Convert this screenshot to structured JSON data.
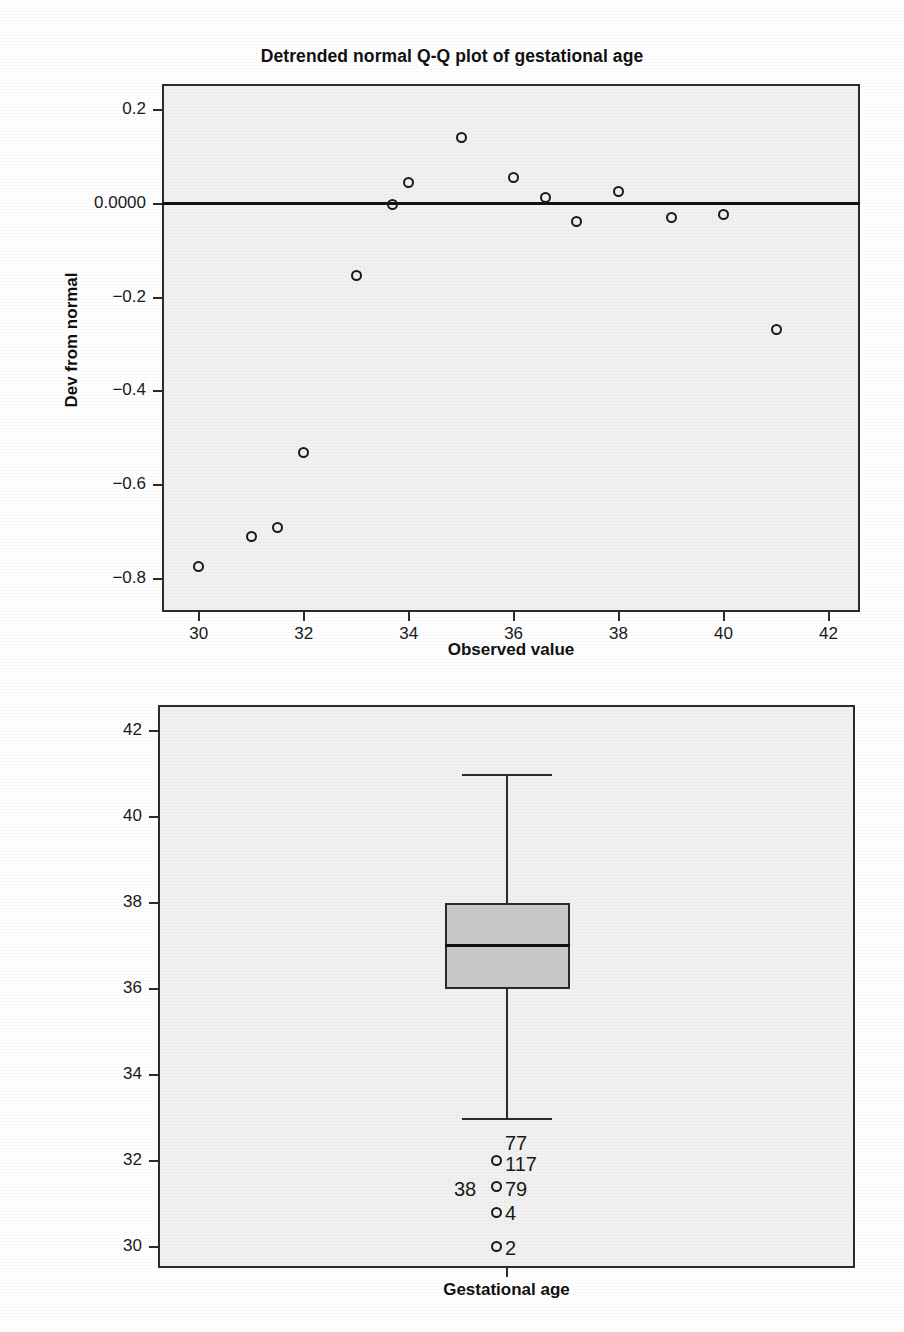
{
  "page": {
    "width": 904,
    "height": 1332,
    "background": "#ffffff",
    "plot_background": "#f1f1f1",
    "ink_color": "#1a1a1a",
    "box_fill": "#c9c9c9"
  },
  "figures": [
    {
      "id": "qq-plot",
      "title": "Detrended normal Q-Q plot of gestational age"
    },
    {
      "id": "boxplot",
      "title": ""
    }
  ],
  "qq": {
    "title": "Detrended normal Q-Q plot of gestational age",
    "xlabel": "Observed value",
    "ylabel": "Dev from normal",
    "yticks": [
      "0.2",
      "0.0000",
      "-0.2",
      "-0.4",
      "-0.6",
      "-0.8"
    ],
    "xticks": [
      "30",
      "32",
      "34",
      "36",
      "38",
      "40",
      "42"
    ]
  },
  "box": {
    "xlabel": "Gestational age",
    "yticks": [
      "42",
      "40",
      "38",
      "36",
      "34",
      "32",
      "30"
    ],
    "outlier_labels": [
      "77",
      "117",
      "38",
      "79",
      "4",
      "2"
    ]
  },
  "chart_data": [
    {
      "type": "scatter",
      "id": "detrended-qq",
      "title": "Detrended normal Q-Q plot of gestational age",
      "xlabel": "Observed value",
      "ylabel": "Dev from normal",
      "xlim": [
        29.3,
        42.6
      ],
      "ylim": [
        -0.87,
        0.255
      ],
      "xticks": [
        30,
        32,
        34,
        36,
        38,
        40,
        42
      ],
      "xticklabels": [
        "30",
        "32",
        "34",
        "36",
        "38",
        "40",
        "42"
      ],
      "yticks": [
        0.2,
        0.0,
        -0.2,
        -0.4,
        -0.6,
        -0.8
      ],
      "yticklabels": [
        "0.2",
        "0.0000",
        "-0.2",
        "-0.4",
        "-0.6",
        "-0.8"
      ],
      "grid": false,
      "legend": null,
      "reference_line": {
        "y": 0.0,
        "style": "solid",
        "color": "#111111"
      },
      "marker": "open-circle",
      "x": [
        30.0,
        31.0,
        31.5,
        32.0,
        33.0,
        33.7,
        34.0,
        35.0,
        36.0,
        36.6,
        37.2,
        38.0,
        39.0,
        40.0,
        41.0
      ],
      "y": [
        -0.773,
        -0.709,
        -0.69,
        -0.531,
        -0.152,
        -0.002,
        0.046,
        0.14,
        0.056,
        0.014,
        -0.038,
        0.026,
        -0.03,
        -0.022,
        -0.268
      ]
    },
    {
      "type": "boxplot",
      "id": "gestational-age-box",
      "title": "",
      "xlabel": "Gestational age",
      "ylabel": "",
      "ylim": [
        29.5,
        42.6
      ],
      "yticks": [
        42,
        40,
        38,
        36,
        34,
        32,
        30
      ],
      "yticklabels": [
        "42",
        "40",
        "38",
        "36",
        "34",
        "32",
        "30"
      ],
      "grid": false,
      "legend": null,
      "boxes": [
        {
          "category": "Gestational age",
          "whisker_high": 41,
          "q3": 38,
          "median": 37,
          "q1": 36,
          "whisker_low": 33,
          "outliers": [
            {
              "value": 32.0,
              "labels": [
                "77",
                "117"
              ]
            },
            {
              "value": 31.4,
              "labels": [
                "38",
                "79"
              ]
            },
            {
              "value": 30.8,
              "labels": [
                "4"
              ]
            },
            {
              "value": 30.0,
              "labels": [
                "2"
              ]
            }
          ]
        }
      ]
    }
  ]
}
